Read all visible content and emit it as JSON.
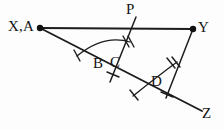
{
  "figure": {
    "background_color": "#fdfdfd",
    "stroke_color": "#1c1c1c",
    "width": 224,
    "height": 130,
    "labels": {
      "xa": "X,A",
      "y": "Y",
      "p": "P",
      "b": "B",
      "c": "C",
      "d": "D",
      "z": "Z"
    },
    "points": {
      "XA": {
        "x": 40,
        "y": 28
      },
      "Y": {
        "x": 193,
        "y": 29
      },
      "P": {
        "x": 135,
        "y": 16
      },
      "B": {
        "x": 106,
        "y": 66
      },
      "C": {
        "x": 112,
        "y": 66
      },
      "D": {
        "x": 160,
        "y": 88
      },
      "Z": {
        "x": 200,
        "y": 113
      }
    },
    "segments": [
      {
        "name": "segment-XY",
        "from": "XA",
        "to": "Y"
      },
      {
        "name": "ray-AZ",
        "from": "XA",
        "to": "Z"
      },
      {
        "name": "line-P-through-BC",
        "from": "P",
        "to": "below-BC"
      },
      {
        "name": "segment-YD-extended",
        "from": "Y",
        "to": "below-D"
      }
    ],
    "arcs": [
      {
        "name": "arc-at-B",
        "vertex": "B",
        "tick_count": 2
      },
      {
        "name": "arc-at-D",
        "vertex": "D",
        "tick_count": 2
      }
    ]
  }
}
